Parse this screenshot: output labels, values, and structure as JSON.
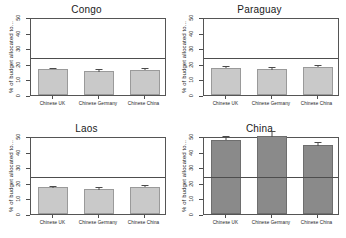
{
  "figure": {
    "width": 346,
    "height": 238,
    "background": "#ffffff",
    "layout": "2x2 panel grid"
  },
  "chart_data": {
    "type": "bar",
    "title": "",
    "xlabel": "",
    "ylabel": "% of budget allocated to...",
    "ylim": [
      0,
      50
    ],
    "yticks": [
      0,
      10,
      20,
      30,
      40,
      50
    ],
    "ytick_labels": [
      "0",
      "10",
      "20",
      "30",
      "40",
      "50"
    ],
    "categories": [
      "Chinese UK",
      "Chinese Germany",
      "Chinese China"
    ],
    "grid": false,
    "legend": "none",
    "reference_line": 25,
    "error_bars": true,
    "panels": [
      {
        "title": "Congo",
        "position": "top-left",
        "bar_color": "#c9c9c9",
        "values": [
          16.5,
          15.2,
          16.2
        ],
        "errors": [
          1.0,
          1.5,
          1.1
        ]
      },
      {
        "title": "Paraguay",
        "position": "top-right",
        "bar_color": "#c9c9c9",
        "values": [
          17.5,
          16.5,
          18.0
        ],
        "errors": [
          1.1,
          1.6,
          1.2
        ]
      },
      {
        "title": "Laos",
        "position": "bottom-left",
        "bar_color": "#c9c9c9",
        "values": [
          17.0,
          15.8,
          17.6
        ],
        "errors": [
          1.2,
          1.4,
          1.2
        ]
      },
      {
        "title": "China",
        "position": "bottom-right",
        "bar_color": "#8a8a8a",
        "values": [
          47.5,
          50.0,
          44.0
        ],
        "errors": [
          2.5,
          3.0,
          2.0
        ]
      }
    ]
  }
}
